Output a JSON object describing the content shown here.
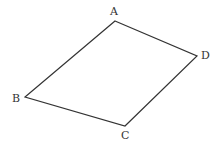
{
  "diagram": {
    "type": "quadrilateral",
    "vertices": [
      {
        "name": "A",
        "x": 115,
        "y": 21
      },
      {
        "name": "D",
        "x": 197,
        "y": 56
      },
      {
        "name": "C",
        "x": 125,
        "y": 126
      },
      {
        "name": "B",
        "x": 25,
        "y": 97
      }
    ],
    "labels": {
      "A": "A",
      "B": "B",
      "C": "C",
      "D": "D"
    },
    "stroke_color": "#333333"
  }
}
